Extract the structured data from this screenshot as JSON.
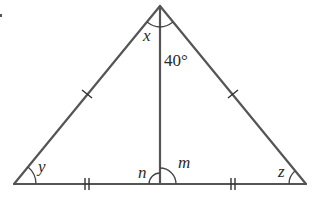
{
  "diagram": {
    "type": "isosceles-triangle-with-altitude",
    "vertices": {
      "apex": [
        160,
        6
      ],
      "left": [
        14,
        184
      ],
      "right": [
        306,
        184
      ],
      "foot": [
        160,
        184
      ]
    },
    "labels": {
      "x": "x",
      "angle_40": "40°",
      "y": "y",
      "n": "n",
      "m": "m",
      "z": "z"
    },
    "marks": {
      "equal_sides": "single tick on left and right slanted sides",
      "equal_base_halves": "double tick on each base half"
    },
    "colors": {
      "line": "#555555",
      "text": "#2a2a2a"
    }
  }
}
